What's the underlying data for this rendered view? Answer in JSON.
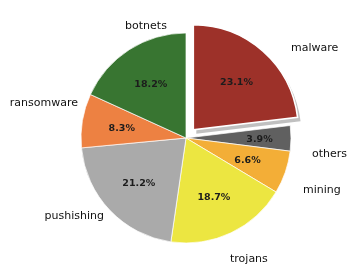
{
  "chart_data": {
    "type": "pie",
    "title": "",
    "subtitle": "",
    "xlabel": "",
    "ylabel": "",
    "legend_position": "outside-labels",
    "grid": false,
    "start_angle_deg": 0,
    "direction": "clockwise",
    "total": 100.0,
    "categories": [
      "malware",
      "others",
      "mining",
      "trojans",
      "pushishing",
      "ransomware",
      "botnets"
    ],
    "values": [
      23.1,
      3.9,
      6.6,
      18.7,
      21.2,
      8.3,
      18.2
    ],
    "value_labels": [
      "23.1%",
      "3.9%",
      "6.6%",
      "18.7%",
      "21.2%",
      "8.3%",
      "18.2%"
    ],
    "colors": [
      "#A03028",
      "#606060",
      "#F5AE33",
      "#EDE63C",
      "#AAAAAA",
      "#F08040",
      "#37762F"
    ],
    "exploded": [
      "malware"
    ],
    "slices": [
      {
        "name": "malware",
        "label": "malware",
        "value": 23.1,
        "value_label": "23.1%",
        "color": "#A03028",
        "exploded": true
      },
      {
        "name": "others",
        "label": "others",
        "value": 3.9,
        "value_label": "3.9%",
        "color": "#606060",
        "exploded": false
      },
      {
        "name": "mining",
        "label": "mining",
        "value": 6.6,
        "value_label": "6.6%",
        "color": "#F5AE33",
        "exploded": false
      },
      {
        "name": "trojans",
        "label": "trojans",
        "value": 18.7,
        "value_label": "18.7%",
        "color": "#EDE63C",
        "exploded": false
      },
      {
        "name": "pushishing",
        "label": "pushishing",
        "value": 21.2,
        "value_label": "21.2%",
        "color": "#AAAAAA",
        "exploded": false
      },
      {
        "name": "ransomware",
        "label": "ransomware",
        "value": 8.3,
        "value_label": "8.3%",
        "color": "#F08040",
        "exploded": false
      },
      {
        "name": "botnets",
        "label": "botnets",
        "value": 18.2,
        "value_label": "18.2%",
        "color": "#37762F",
        "exploded": false
      }
    ]
  },
  "labels": {
    "malware": "malware",
    "others": "others",
    "mining": "mining",
    "trojans": "trojans",
    "pushishing": "pushishing",
    "ransomware": "ransomware",
    "botnets": "botnets"
  },
  "percents": {
    "malware": "23.1%",
    "others": "3.9%",
    "mining": "6.6%",
    "trojans": "18.7%",
    "pushishing": "21.2%",
    "ransomware": "8.3%",
    "botnets": "18.2%"
  },
  "palette": {
    "malware": "#A03028",
    "others": "#606060",
    "mining": "#F5AE33",
    "trojans": "#EDE63C",
    "pushishing": "#AAAAAA",
    "ransomware": "#F08040",
    "botnets": "#37762F",
    "background": "#FFFFFF",
    "shadow": "#BDBDBD",
    "text": "#111111"
  }
}
